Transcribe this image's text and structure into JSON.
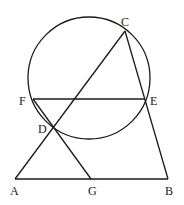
{
  "diagram": {
    "type": "geometry",
    "points": {
      "A": {
        "label": "A",
        "x": 15,
        "y": 179,
        "lx": 10,
        "ly": 195
      },
      "G": {
        "label": "G",
        "x": 91,
        "y": 179,
        "lx": 88,
        "ly": 195
      },
      "B": {
        "label": "B",
        "x": 168,
        "y": 179,
        "lx": 165,
        "ly": 195
      },
      "C": {
        "label": "C",
        "x": 125,
        "y": 31,
        "lx": 121,
        "ly": 26
      },
      "D": {
        "label": "D",
        "x": 53,
        "y": 127,
        "lx": 38,
        "ly": 133
      },
      "E": {
        "label": "E",
        "x": 145,
        "y": 99,
        "lx": 150,
        "ly": 105
      },
      "F": {
        "label": "F",
        "x": 33,
        "y": 99,
        "lx": 19,
        "ly": 105
      }
    },
    "circle": {
      "cx": 89,
      "cy": 78,
      "r": 61
    },
    "segments": [
      [
        "A",
        "B"
      ],
      [
        "A",
        "C"
      ],
      [
        "C",
        "B"
      ],
      [
        "F",
        "E"
      ],
      [
        "F",
        "G"
      ]
    ],
    "stroke_color": "#1a1a1a",
    "background": "#ffffff"
  }
}
